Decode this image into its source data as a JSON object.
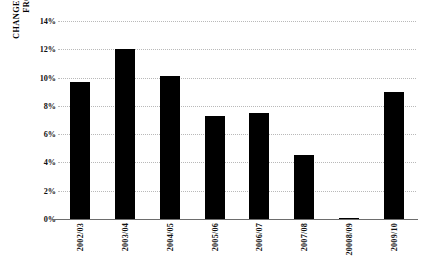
{
  "chart_data": {
    "type": "bar",
    "title": "",
    "subtitle": "",
    "xlabel": "",
    "ylabel": "CHANGE IN LATINO ENROLLMENT FROM PREVIOUS YEAR",
    "ylabel_lines": [
      "CHANGE IN LATINO ENROLLMENT",
      "FROM PREVIOUS YEAR"
    ],
    "categories": [
      "2002/03",
      "2003/04",
      "2004/05",
      "2005/06",
      "2006/07",
      "2007/08",
      "20008/09",
      "2009/10"
    ],
    "values": [
      9.7,
      12.0,
      10.1,
      7.3,
      7.5,
      4.5,
      0.1,
      9.0
    ],
    "value_labels": [
      "",
      "",
      "",
      "",
      "",
      "",
      "",
      ""
    ],
    "ylim": [
      0,
      14
    ],
    "yticks": [
      0,
      2,
      4,
      6,
      8,
      10,
      12,
      14
    ],
    "ytick_labels": [
      "0%",
      "2%",
      "4%",
      "6%",
      "8%",
      "10%",
      "12%",
      "14%"
    ],
    "grid": true,
    "grid_axis": "y",
    "legend": false,
    "legend_position": "none",
    "bar_color": "#000000",
    "gridline_color": "#b9b9b9",
    "axis_color": "#6d6d6d",
    "background_color": "#ffffff",
    "text_color": "#111111"
  }
}
